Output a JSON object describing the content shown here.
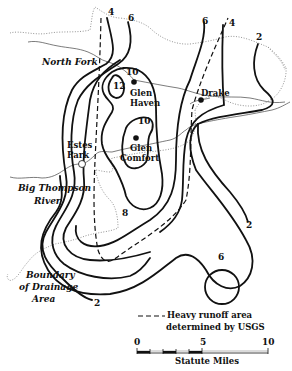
{
  "map": {
    "type": "isohyet contour map",
    "places": [
      {
        "name": "Drake"
      },
      {
        "name": "Glen Haven"
      },
      {
        "name": "Glen Comfort"
      },
      {
        "name": "Estes Park"
      }
    ],
    "rivers": [
      {
        "name": "North Fork"
      },
      {
        "name": "Big Thompson River",
        "line1": "Big Thompson",
        "line2": "River"
      }
    ],
    "boundary_label": {
      "line1": "Boundary",
      "line2": "of Drainage",
      "line3": "Area"
    },
    "contour_labels": [
      "4",
      "6",
      "6",
      "4",
      "2",
      "10",
      "12",
      "10",
      "8",
      "2",
      "6",
      "2"
    ],
    "legend": {
      "line1": "Heavy runoff area",
      "line2": "determined by USGS",
      "symbol": "dashed-line"
    },
    "scale": {
      "ticks": [
        "0",
        "5",
        "10"
      ],
      "unit": "Statute Miles"
    }
  },
  "labels": {
    "north_fork": "North Fork",
    "big_thompson_1": "Big Thompson",
    "big_thompson_2": "River",
    "boundary_1": "Boundary",
    "boundary_2": "of Drainage",
    "boundary_3": "Area",
    "drake": "Drake",
    "glen_haven_1": "Glen",
    "glen_haven_2": "Haven",
    "glen_comfort_1": "Glen",
    "glen_comfort_2": "Comfort",
    "estes_1": "Estes",
    "estes_2": "Park",
    "c4_top": "4",
    "c6_topleft": "6",
    "c6_topmid": "6",
    "c4_topright": "4",
    "c2_topright": "2",
    "c10_a": "10",
    "c12": "12",
    "c10_b": "10",
    "c8": "8",
    "c2_right": "2",
    "c6_circle": "6",
    "c2_bottom": "2",
    "legend_1": "Heavy runoff area",
    "legend_2": "determined by USGS",
    "scale_0": "0",
    "scale_5": "5",
    "scale_10": "10",
    "scale_unit": "Statute Miles"
  }
}
